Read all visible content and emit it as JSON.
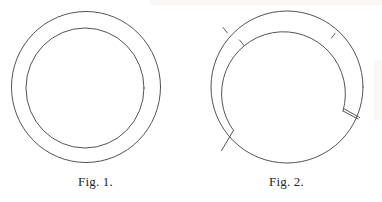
{
  "plate": {
    "name": "two-figure-plate",
    "background_color": "#ffffff",
    "ink_color": "#3a3a3a",
    "width": 382,
    "height": 202
  },
  "figures": [
    {
      "id": "fig-1",
      "caption": "Fig. 1.",
      "description": "Plain annular ring: two concentric circles forming an unbroken band.",
      "geometry": {
        "center_x": 86,
        "center_y": 87,
        "outer_radius": 75,
        "inner_radius": 60,
        "outer_circle": "complete",
        "inner_circle": "complete"
      },
      "marks": []
    },
    {
      "id": "fig-2",
      "caption": "Fig. 2.",
      "description": "Annular ring whose inner circle is interrupted: the inner arc terminates at two break points in the lower half, each joined to the outer circle by a short radial bar, leaving the lower band solid. Two small tick marks cross the band in the upper left and upper right.",
      "geometry": {
        "center_x": 96,
        "center_y": 87,
        "outer_radius": 76,
        "inner_radius": 62,
        "outer_circle": "complete",
        "inner_circle": "broken",
        "inner_arc_start_deg": 150,
        "inner_arc_end_deg": 25,
        "break_left_deg": 150,
        "break_right_deg": 25
      },
      "marks": [
        {
          "name": "tick-upper-left",
          "angle_deg": 208,
          "on": "outer"
        },
        {
          "name": "tick-upper-left-inner",
          "angle_deg": 200,
          "on": "inner"
        },
        {
          "name": "tick-upper-right",
          "angle_deg": 290,
          "on": "inner"
        },
        {
          "name": "radial-bar-lower-left",
          "angle_deg": 150
        },
        {
          "name": "radial-bar-lower-right",
          "angle_deg": 25
        }
      ]
    }
  ]
}
